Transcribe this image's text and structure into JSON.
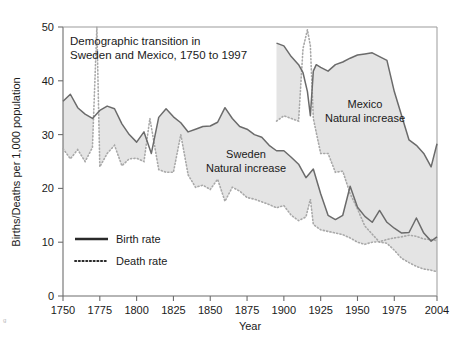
{
  "figure": {
    "width": 461,
    "height": 351,
    "background": "#ffffff"
  },
  "chart_data": {
    "type": "line",
    "title": "Demographic transition in\nSweden and Mexico, 1750 to 1997",
    "title_line1": "Demographic transition in",
    "title_line2": "Sweden and Mexico, 1750 to 1997",
    "xlabel": "Year",
    "ylabel": "Births/Deaths per 1,000 population",
    "xlim": [
      1750,
      2004
    ],
    "ylim": [
      0,
      50
    ],
    "xticks": [
      1750,
      1775,
      1800,
      1825,
      1850,
      1875,
      1900,
      1925,
      1950,
      1975,
      2004
    ],
    "xtick_labels": [
      "1750",
      "1775",
      "1800",
      "1825",
      "1850",
      "1875",
      "1900",
      "1925",
      "1950",
      "1975",
      "2004"
    ],
    "yticks": [
      0,
      10,
      20,
      30,
      40,
      50
    ],
    "ytick_labels": [
      "0",
      "10",
      "20",
      "30",
      "40",
      "50"
    ],
    "grid": false,
    "legend_position": "lower-left-inside",
    "legend": [
      {
        "name": "Birth rate",
        "style": "solid"
      },
      {
        "name": "Death rate",
        "style": "dotted"
      }
    ],
    "annotations": [
      {
        "text_line1": "Sweden",
        "text_line2": "Natural increase",
        "x": 1858,
        "y": 21.5
      },
      {
        "text_line1": "Mexico",
        "text_line2": "Natural increase",
        "x": 1943,
        "y": 36.5
      }
    ],
    "colors": {
      "birth_line": "#6b6b6b",
      "death_line": "#a8a8a8",
      "fill": "#e4e4e4",
      "axis": "#6d6d6d",
      "text": "#1a1a1a"
    },
    "series": [
      {
        "name": "Sweden Birth rate",
        "country": "Sweden",
        "style": "solid",
        "x": [
          1750,
          1755,
          1760,
          1765,
          1770,
          1775,
          1780,
          1785,
          1790,
          1795,
          1800,
          1805,
          1810,
          1815,
          1820,
          1825,
          1830,
          1835,
          1840,
          1845,
          1850,
          1855,
          1860,
          1865,
          1870,
          1875,
          1880,
          1885,
          1890,
          1895,
          1900,
          1905,
          1910,
          1915,
          1920,
          1925,
          1930,
          1935,
          1940,
          1945,
          1950,
          1955,
          1960,
          1965,
          1970,
          1975,
          1980,
          1985,
          1990,
          1995,
          2000,
          2004
        ],
        "y": [
          36.2,
          37.5,
          35.0,
          33.8,
          33.0,
          34.5,
          35.3,
          34.8,
          32.0,
          30.0,
          28.6,
          30.5,
          26.5,
          33.2,
          34.8,
          33.3,
          32.2,
          30.5,
          31.0,
          31.5,
          31.6,
          32.3,
          35.0,
          33.0,
          31.5,
          31.0,
          30.0,
          29.5,
          28.0,
          27.0,
          27.0,
          25.8,
          24.5,
          22.0,
          23.6,
          19.0,
          15.0,
          14.2,
          15.0,
          20.4,
          16.5,
          14.8,
          13.7,
          15.9,
          13.7,
          12.6,
          11.7,
          11.8,
          14.5,
          11.7,
          10.2,
          11.0
        ]
      },
      {
        "name": "Sweden Death rate",
        "country": "Sweden",
        "style": "dotted",
        "x": [
          1750,
          1755,
          1760,
          1765,
          1770,
          1773,
          1775,
          1780,
          1785,
          1790,
          1795,
          1800,
          1805,
          1809,
          1815,
          1820,
          1825,
          1830,
          1835,
          1840,
          1845,
          1850,
          1855,
          1860,
          1865,
          1870,
          1875,
          1880,
          1885,
          1890,
          1895,
          1900,
          1905,
          1910,
          1915,
          1918,
          1920,
          1925,
          1930,
          1935,
          1940,
          1945,
          1950,
          1955,
          1960,
          1965,
          1970,
          1975,
          1980,
          1985,
          1990,
          1995,
          2000,
          2004
        ],
        "y": [
          27.4,
          25.5,
          27.2,
          25.0,
          27.6,
          52.0,
          24.0,
          26.5,
          28.0,
          24.2,
          25.5,
          25.6,
          25.0,
          33.0,
          23.5,
          23.0,
          23.0,
          30.0,
          22.5,
          20.2,
          20.6,
          19.8,
          21.7,
          17.6,
          20.2,
          19.5,
          18.3,
          18.0,
          17.5,
          17.0,
          16.4,
          16.8,
          15.0,
          14.0,
          14.7,
          18.0,
          13.3,
          12.3,
          12.0,
          11.7,
          11.4,
          10.8,
          10.0,
          9.6,
          10.0,
          10.1,
          10.5,
          10.8,
          11.0,
          11.3,
          11.1,
          10.6,
          10.5,
          10.3
        ]
      },
      {
        "name": "Mexico Birth rate",
        "country": "Mexico",
        "style": "solid",
        "x": [
          1895,
          1900,
          1905,
          1910,
          1913,
          1916,
          1918,
          1920,
          1922,
          1925,
          1930,
          1935,
          1940,
          1945,
          1950,
          1955,
          1960,
          1965,
          1970,
          1975,
          1980,
          1985,
          1990,
          1995,
          2000,
          2004
        ],
        "y": [
          47.0,
          46.5,
          44.5,
          43.0,
          41.5,
          38.0,
          33.5,
          41.8,
          43.0,
          42.5,
          41.8,
          43.0,
          43.5,
          44.2,
          44.8,
          45.0,
          45.2,
          44.5,
          43.8,
          38.0,
          33.5,
          29.0,
          28.0,
          26.5,
          24.0,
          28.3
        ]
      },
      {
        "name": "Mexico Death rate",
        "country": "Mexico",
        "style": "dotted",
        "x": [
          1895,
          1900,
          1905,
          1910,
          1913,
          1916,
          1918,
          1920,
          1925,
          1930,
          1935,
          1940,
          1945,
          1950,
          1955,
          1960,
          1965,
          1970,
          1975,
          1980,
          1985,
          1990,
          1995,
          2000,
          2004
        ],
        "y": [
          32.5,
          33.5,
          33.0,
          32.5,
          46.0,
          49.5,
          46.5,
          33.0,
          26.5,
          26.5,
          23.0,
          23.2,
          19.0,
          16.2,
          13.0,
          11.5,
          10.0,
          9.8,
          8.5,
          7.0,
          6.2,
          5.5,
          5.0,
          4.8,
          4.5
        ]
      }
    ]
  },
  "edge_artifact": "g"
}
